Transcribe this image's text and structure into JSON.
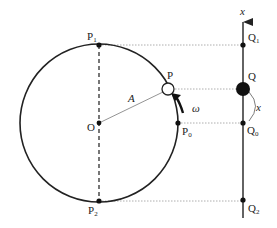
{
  "diagram": {
    "type": "uniform circular motion projected onto x-axis (simple harmonic motion)",
    "colors": {
      "line": "#222222",
      "dotted": "#999999",
      "background": "#ffffff"
    },
    "circle": {
      "center_label": "O",
      "radius_label": "A"
    },
    "points": {
      "P": {
        "label": "P",
        "sub": ""
      },
      "P0": {
        "label": "P",
        "sub": "0"
      },
      "P1": {
        "label": "P",
        "sub": "1"
      },
      "P2": {
        "label": "P",
        "sub": "2"
      },
      "Q": {
        "label": "Q",
        "sub": ""
      },
      "Q0": {
        "label": "Q",
        "sub": "0"
      },
      "Q1": {
        "label": "Q",
        "sub": "1"
      },
      "Q2": {
        "label": "Q",
        "sub": "2"
      }
    },
    "axis": {
      "label": "x"
    },
    "displacement_label": "x",
    "angular_velocity_label": "ω"
  }
}
